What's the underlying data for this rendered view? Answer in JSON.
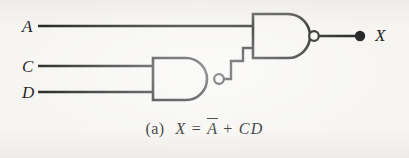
{
  "figure": {
    "kind": "logic-circuit-diagram",
    "caption_index": "(a)",
    "caption_equation_parts": {
      "output": "X",
      "equals": "=",
      "term1_base": "A",
      "term1_complemented": true,
      "operator": "+",
      "term2": "CD"
    },
    "caption_plain": "(a) X = A̅ + CD",
    "background_color": "#f6f5f2",
    "ink_color": "#1b1b1b"
  },
  "inputs": [
    {
      "label": "A",
      "x": 24,
      "y": 27,
      "wire_y": 26,
      "wire_from_x": 38,
      "wire_to_x": 253
    },
    {
      "label": "C",
      "x": 24,
      "y": 67,
      "wire_y": 66,
      "wire_from_x": 38,
      "wire_to_x": 153
    },
    {
      "label": "D",
      "x": 24,
      "y": 93,
      "wire_y": 92,
      "wire_from_x": 38,
      "wire_to_x": 153
    }
  ],
  "gates": [
    {
      "id": "gate-nand-cd",
      "type": "NAND",
      "label": "lower-nand-gate",
      "inputs": [
        "C",
        "D"
      ],
      "output_bubble": true,
      "body": {
        "left": 152,
        "top": 58,
        "right": 214,
        "bottom": 100
      },
      "bubble": {
        "cx": 219,
        "cy": 79,
        "r": 5
      }
    },
    {
      "id": "gate-nand-out",
      "type": "NAND",
      "label": "output-nand-gate",
      "inputs": [
        "A",
        "gate-nand-cd"
      ],
      "output_bubble": true,
      "body": {
        "left": 252,
        "top": 14,
        "right": 309,
        "bottom": 58
      },
      "bubble": {
        "cx": 314,
        "cy": 36,
        "r": 5
      }
    }
  ],
  "nets": [
    {
      "name": "cd-nand-to-output-gate",
      "points": "224,79 231,79 231,61 243,61 243,48 253,48"
    },
    {
      "name": "output-net",
      "points": "319,36 358,36"
    }
  ],
  "output": {
    "label": "X",
    "label_x": 377,
    "label_y": 36,
    "terminal_dot": {
      "cx": 360,
      "cy": 36,
      "r": 5.2
    }
  }
}
